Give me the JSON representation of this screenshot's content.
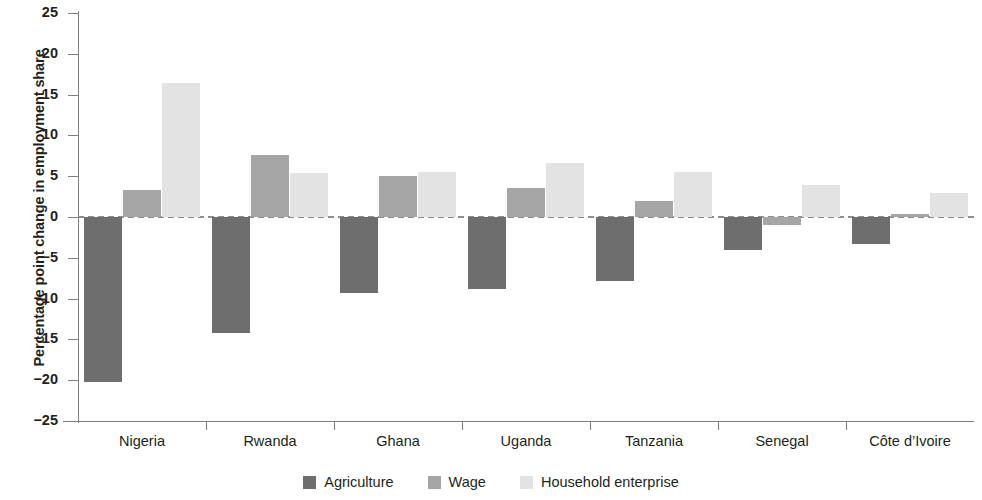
{
  "chart_data": {
    "type": "bar",
    "title": "",
    "subtitle": "",
    "xlabel": "",
    "ylabel": "Percentage point change in employment share",
    "ylim": [
      -25,
      25
    ],
    "ytick_step": 5,
    "yticks": [
      25,
      20,
      15,
      10,
      5,
      0,
      -5,
      -10,
      -15,
      -20,
      -25
    ],
    "ytick_labels": [
      "25",
      "20",
      "15",
      "10",
      "5",
      "0",
      "−5",
      "−10",
      "−15",
      "−20",
      "−25"
    ],
    "grid": false,
    "zero_reference_line": true,
    "legend_position": "bottom-center",
    "categories": [
      "Nigeria",
      "Rwanda",
      "Ghana",
      "Uganda",
      "Tanzania",
      "Senegal",
      "Côte d’Ivoire"
    ],
    "series": [
      {
        "name": "Agriculture",
        "color": "#6e6e6e",
        "values": [
          -20.2,
          -14.2,
          -9.3,
          -8.8,
          -7.8,
          -4.0,
          -3.3
        ]
      },
      {
        "name": "Wage",
        "color": "#a6a6a6",
        "values": [
          3.3,
          7.6,
          5.0,
          3.5,
          2.0,
          -1.0,
          0.4
        ]
      },
      {
        "name": "Household enterprise",
        "color": "#e3e3e3",
        "values": [
          16.4,
          5.4,
          5.5,
          6.6,
          5.5,
          3.9,
          3.0
        ]
      }
    ]
  },
  "legend": {
    "items": [
      {
        "label": "Agriculture",
        "swatch": "agriculture"
      },
      {
        "label": "Wage",
        "swatch": "wage"
      },
      {
        "label": "Household enterprise",
        "swatch": "household"
      }
    ]
  },
  "colors": {
    "agriculture": "#6e6e6e",
    "wage": "#a6a6a6",
    "household_enterprise": "#e3e3e3",
    "axis": "#7f7f7f",
    "zero_line": "#8d8d8d",
    "text": "#231f20",
    "background": "#ffffff"
  }
}
